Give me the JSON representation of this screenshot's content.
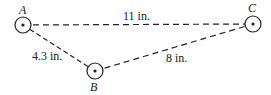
{
  "diagram": {
    "points": [
      {
        "id": "A",
        "label": "A",
        "x": 23,
        "y": 25
      },
      {
        "id": "B",
        "label": "B",
        "x": 95,
        "y": 71
      },
      {
        "id": "C",
        "label": "C",
        "x": 253,
        "y": 24
      }
    ],
    "segments": [
      {
        "from": "A",
        "to": "C",
        "label": "11 in."
      },
      {
        "from": "A",
        "to": "B",
        "label": "4.3 in."
      },
      {
        "from": "B",
        "to": "C",
        "label": "8 in."
      }
    ],
    "colors": {
      "stroke": "#222222",
      "background": "#ffffff"
    }
  }
}
